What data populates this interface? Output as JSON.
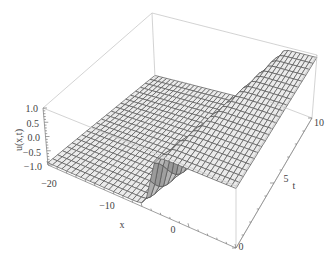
{
  "chart_data": {
    "type": "surface3d",
    "title": "",
    "function_description": "kink (tanh-like) solution u(x,t) rising from -1 to 1 across a front that moves with t",
    "xlabel": "x",
    "ylabel": "t",
    "zlabel": "u(x,t)",
    "x_range": [
      -20,
      20
    ],
    "t_range": [
      0,
      10
    ],
    "z_range": [
      -1.0,
      1.0
    ],
    "x_ticks": [
      "-20",
      "-10",
      "0"
    ],
    "t_ticks": [
      "0",
      "5",
      "10"
    ],
    "z_ticks": [
      "1.0",
      "0.5",
      "0.0",
      "-0.5",
      "-1.0"
    ],
    "grid": false,
    "mesh": true,
    "colors": {
      "surface": "#e8e8e8",
      "mesh": "#555555",
      "box": "#c8c8c8",
      "text": "#444444"
    }
  },
  "labels": {
    "z_axis": "u(x,t)",
    "x_axis": "x",
    "t_axis": "t",
    "z_ticks": [
      "1.0",
      "0.5",
      "0.0",
      "−0.5",
      "−1.0"
    ],
    "x_ticks": [
      "−20",
      "−10",
      "0"
    ],
    "t_ticks": [
      "0",
      "5",
      "10"
    ]
  }
}
